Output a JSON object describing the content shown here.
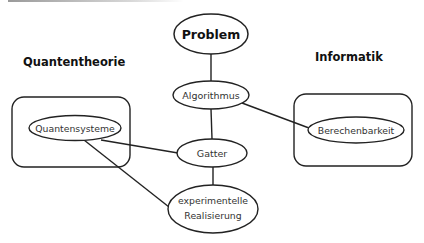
{
  "diagram": {
    "groups": [
      {
        "id": "quantentheorie",
        "title": "Quantentheorie"
      },
      {
        "id": "informatik",
        "title": "Informatik"
      }
    ],
    "nodes": {
      "problem": {
        "label": "Problem",
        "emphasis": "bold"
      },
      "algorithmus": {
        "label": "Algorithmus"
      },
      "gatter": {
        "label": "Gatter"
      },
      "quantensysteme": {
        "label": "Quantensysteme",
        "group": "quantentheorie"
      },
      "berechenbarkeit": {
        "label": "Berechenbarkeit",
        "group": "informatik"
      },
      "realisierung": {
        "label_line1": "experimentelle",
        "label_line2": "Realisierung"
      }
    },
    "edges": [
      {
        "from": "problem",
        "to": "algorithmus"
      },
      {
        "from": "algorithmus",
        "to": "gatter"
      },
      {
        "from": "algorithmus",
        "to": "berechenbarkeit"
      },
      {
        "from": "quantensysteme",
        "to": "gatter"
      },
      {
        "from": "quantensysteme",
        "to": "realisierung"
      },
      {
        "from": "gatter",
        "to": "realisierung"
      }
    ],
    "colors": {
      "stroke": "#222222",
      "text": "#333333",
      "background": "#ffffff"
    }
  }
}
